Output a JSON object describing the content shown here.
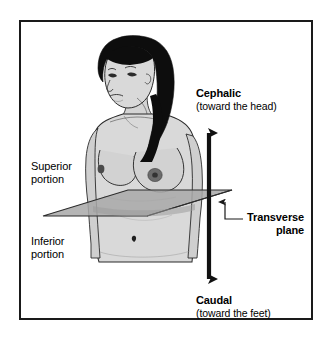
{
  "figure": {
    "frame": {
      "border_color": "#1a1a1a",
      "background": "#ffffff"
    },
    "labels": {
      "cephalic": {
        "term": "Cephalic",
        "gloss": "(toward the head)"
      },
      "caudal": {
        "term": "Caudal",
        "gloss": "(toward the feet)"
      },
      "superior": {
        "line1": "Superior",
        "line2": "portion"
      },
      "inferior": {
        "line1": "Inferior",
        "line2": "portion"
      },
      "transverse": {
        "line1": "Transverse",
        "line2": "plane"
      }
    },
    "colors": {
      "outline": "#1a1a1a",
      "hair": "#0d0d0d",
      "skin": "#d9d9d9",
      "skin_shadow": "#bfbfbf",
      "plane_fill": "#a8a8a8",
      "plane_edge": "#2b2b2b",
      "arrow": "#111111",
      "leader": "#1a1a1a"
    },
    "icons": {
      "axis_arrow": "double-headed-vertical-arrow",
      "leader": "elbow-leader-line-with-arrowhead"
    }
  }
}
